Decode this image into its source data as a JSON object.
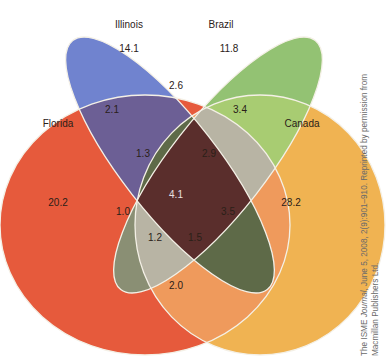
{
  "diagram": {
    "type": "venn-4-set",
    "sets": [
      {
        "name": "Illinois",
        "color": "#6e7fd0"
      },
      {
        "name": "Brazil",
        "color": "#8fbf6c"
      },
      {
        "name": "Florida",
        "color": "#e8573a"
      },
      {
        "name": "Canada",
        "color": "#f0b04c"
      }
    ],
    "regions": {
      "illinois_only": "14.1",
      "brazil_only": "11.8",
      "florida_only": "20.2",
      "canada_only": "28.2",
      "illinois_brazil": "2.6",
      "illinois_florida": "2.1",
      "brazil_canada": "3.4",
      "illinois_brazil_florida": "1.3",
      "illinois_brazil_canada": "2.9",
      "all_four": "4.1",
      "brazil_florida": "1.0",
      "brazil_canada_only_lower": "3.5",
      "brazil_florida_canada": "1.2",
      "illinois_florida_canada": "1.5",
      "florida_canada": "2.0"
    }
  },
  "credit": {
    "line1_prefix": "The ISME ",
    "line1_italic": "Journal",
    "line1_rest": ", June 5, 2008, 2(9):901–910. Reprinted by permission from",
    "line2": "Macmillan Publishers Ltd."
  }
}
